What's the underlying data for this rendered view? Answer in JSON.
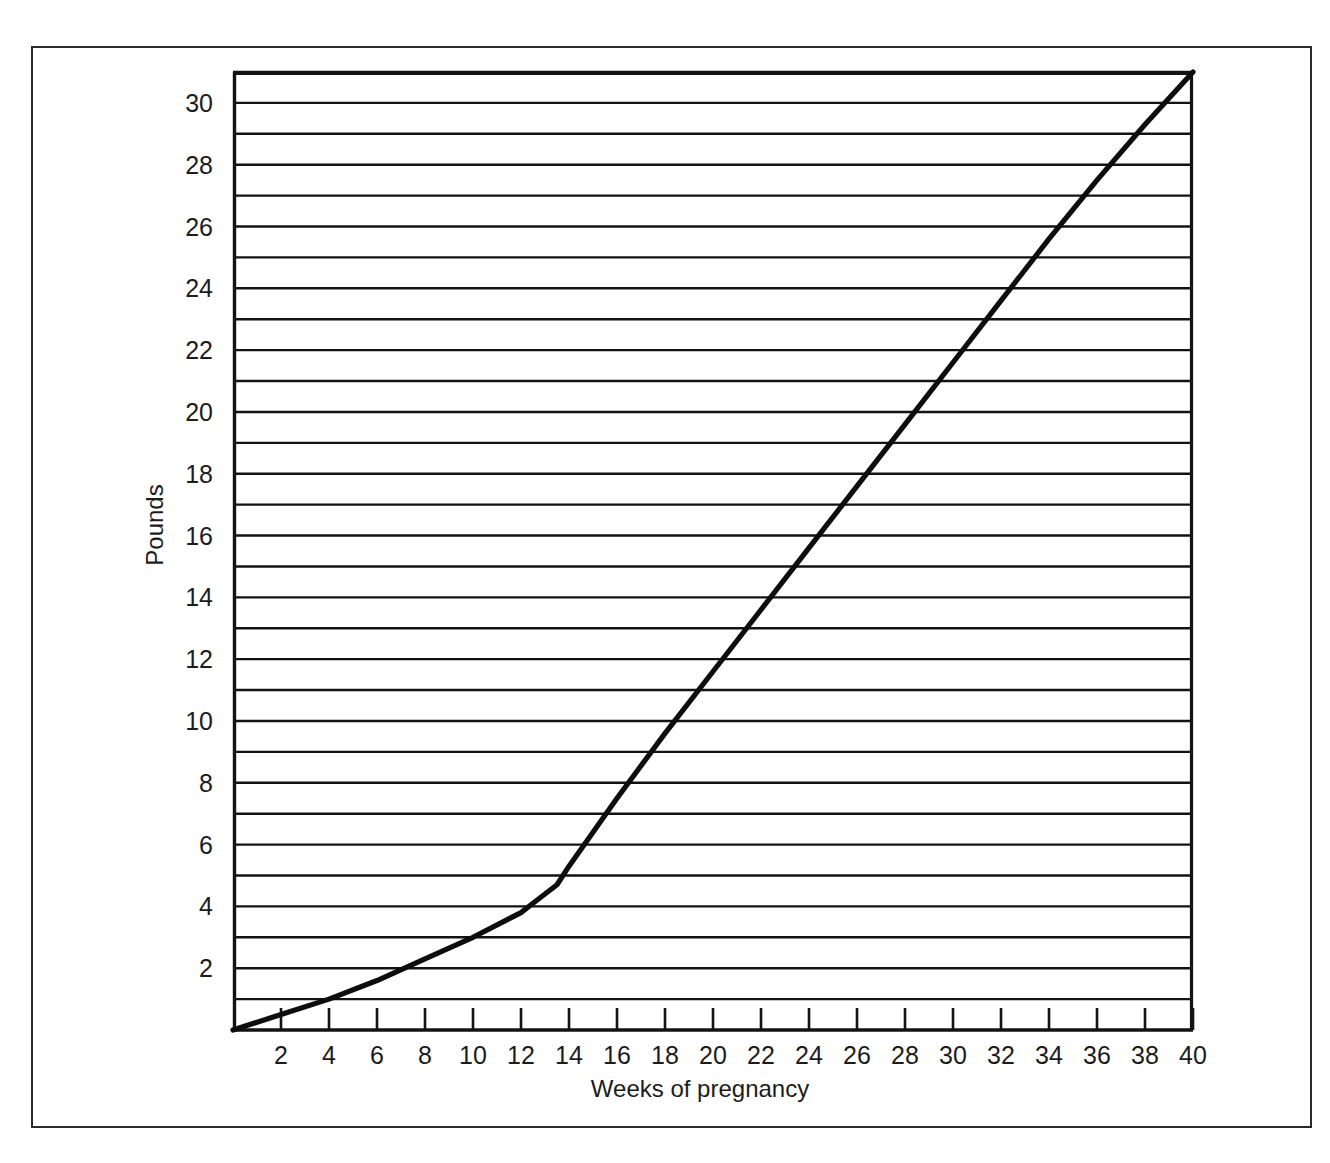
{
  "figure": {
    "background_color": "#ffffff",
    "frame_color": "#2b2b2b",
    "ink_color": "#111111"
  },
  "chart_data": {
    "type": "line",
    "title": "",
    "subtitle": "",
    "xlabel": "Weeks of pregnancy",
    "ylabel": "Pounds",
    "xlim": [
      0,
      40
    ],
    "ylim": [
      0,
      31
    ],
    "grid": "horizontal gridlines at every 1 pound",
    "legend": "none",
    "xticks": [
      2,
      4,
      6,
      8,
      10,
      12,
      14,
      16,
      18,
      20,
      22,
      24,
      26,
      28,
      30,
      32,
      34,
      36,
      38,
      40
    ],
    "xtick_labels": [
      "2",
      "4",
      "6",
      "8",
      "10",
      "12",
      "14",
      "16",
      "18",
      "20",
      "22",
      "24",
      "26",
      "28",
      "30",
      "32",
      "34",
      "36",
      "38",
      "40"
    ],
    "yticks": [
      2,
      4,
      6,
      8,
      10,
      12,
      14,
      16,
      18,
      20,
      22,
      24,
      26,
      28,
      30
    ],
    "ytick_labels": [
      "2",
      "4",
      "6",
      "8",
      "10",
      "12",
      "14",
      "16",
      "18",
      "20",
      "22",
      "24",
      "26",
      "28",
      "30"
    ],
    "gridline_values": [
      1,
      2,
      3,
      4,
      5,
      6,
      7,
      8,
      9,
      10,
      11,
      12,
      13,
      14,
      15,
      16,
      17,
      18,
      19,
      20,
      21,
      22,
      23,
      24,
      25,
      26,
      27,
      28,
      29,
      30,
      31
    ],
    "series": [
      {
        "name": "Recommended weight gain",
        "x": [
          0,
          2,
          4,
          6,
          8,
          10,
          12,
          12.5,
          13,
          13.5,
          14,
          15,
          16,
          18,
          20,
          22,
          24,
          26,
          28,
          30,
          32,
          34,
          36,
          38,
          40
        ],
        "values": [
          0,
          0.5,
          1.0,
          1.6,
          2.3,
          3.0,
          3.8,
          4.1,
          4.4,
          4.7,
          5.3,
          6.4,
          7.5,
          9.6,
          11.6,
          13.6,
          15.6,
          17.6,
          19.6,
          21.6,
          23.6,
          25.6,
          27.5,
          29.3,
          31.0
        ]
      }
    ]
  },
  "axis_geometry": {
    "plot_left_px": 233,
    "plot_right_px": 1193,
    "plot_top_px": 72,
    "plot_bottom_px": 1030,
    "px_per_week": 24,
    "px_per_pound": 30.9
  }
}
